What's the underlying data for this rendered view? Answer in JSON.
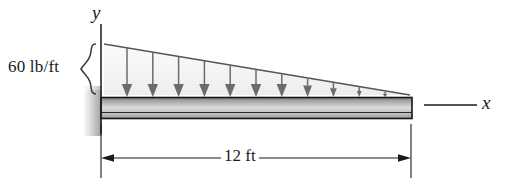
{
  "figure": {
    "labels": {
      "load_intensity": "60 lb/ft",
      "span_dimension": "12 ft",
      "axis_y": "y",
      "axis_x": "x"
    },
    "colors": {
      "line": "#1a1a1a",
      "load_fill_light": "#f2f2f2",
      "load_fill_dark": "#8c8c8c",
      "beam_top": "#8f8f8f",
      "beam_mid": "#d8d8d8",
      "beam_bottom": "#6e6e6e",
      "wall_shade": "#b8b8b8",
      "arrow": "#6b6b6b"
    },
    "geometry": {
      "beam_left_x": 101,
      "beam_right_x": 412,
      "beam_top_y": 98,
      "beam_bottom_y": 118,
      "load_apex_y": 44,
      "load_base_y": 96,
      "dimension_line_y": 158,
      "arrow_count": 12,
      "arrow_first_x": 127,
      "arrow_spacing": 25.8
    },
    "engineering": {
      "load_type": "triangular-distributed",
      "max_intensity_value": 60,
      "max_intensity_units": "lb/ft",
      "max_intensity_location": "fixed-end-left",
      "min_intensity_value": 0,
      "min_intensity_location": "free-end-right",
      "span_value": 12,
      "span_units": "ft",
      "support_type": "fixed-wall-left"
    }
  }
}
